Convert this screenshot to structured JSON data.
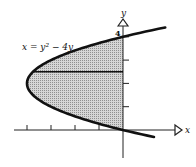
{
  "diagram": {
    "equation_label": "x = y² − 4y",
    "x_axis_label": "x",
    "y_axis_label": "y",
    "y_tick_label": "4",
    "curve": {
      "a": 1,
      "b": -4,
      "c": 0,
      "y_min": -0.3,
      "y_max": 4.4
    },
    "shaded_region": {
      "x_right": 0,
      "y_from": 0,
      "y_to": 4
    },
    "strip_y": 2.5,
    "x_ticks": [
      -4,
      -3,
      -2,
      -1
    ],
    "y_ticks": [
      1,
      2,
      3,
      4
    ],
    "colors": {
      "curve": "#111111",
      "shade": "#b8b8b8",
      "axis": "#222222"
    }
  }
}
